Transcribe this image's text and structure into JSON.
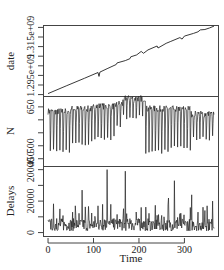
{
  "chart_data": {
    "type": "line",
    "title": "",
    "layout": "3 stacked panels sharing x-axis",
    "xlabel": "Time",
    "x_ticks": [
      0,
      100,
      200,
      300
    ],
    "xlim": [
      -10,
      375
    ],
    "grid": false,
    "legend": null,
    "panels": [
      {
        "name": "date",
        "ylabel": "date",
        "y_tick_labels": [
          "1.295e+09",
          "1.315e+09"
        ],
        "y_ticks": [
          1285000000.0,
          1290000000.0,
          1295000000.0,
          1300000000.0,
          1305000000.0,
          1310000000.0,
          1315000000.0,
          1320000000.0
        ],
        "ylim": [
          1284000000.0,
          1321000000.0
        ],
        "description": "approximately linear increase with small dips/steps",
        "series": {
          "x": [
            0,
            40,
            80,
            110,
            112,
            114,
            130,
            150,
            152,
            170,
            180,
            182,
            195,
            205,
            210,
            220,
            240,
            242,
            260,
            270,
            290,
            295,
            300,
            320,
            330,
            335,
            345,
            355,
            365
          ],
          "y": [
            1285500000.0,
            1289500000.0,
            1293500000.0,
            1296500000.0,
            1294500000.0,
            1296700000.0,
            1298500000.0,
            1300700000.0,
            1301500000.0,
            1302700000.0,
            1303700000.0,
            1304700000.0,
            1305700000.0,
            1307500000.0,
            1306500000.0,
            1308300000.0,
            1310300000.0,
            1309300000.0,
            1311700000.0,
            1312700000.0,
            1314700000.0,
            1313900000.0,
            1315500000.0,
            1316900000.0,
            1317700000.0,
            1318700000.0,
            1318900000.0,
            1319700000.0,
            1320700000.0
          ]
        }
      },
      {
        "name": "N",
        "ylabel": "N",
        "y_tick_labels": [
          "450",
          "500",
          "650"
        ],
        "y_ticks": [
          450,
          500,
          550,
          600,
          650
        ],
        "ylim": [
          420,
          690
        ],
        "description": "weekly oscillation between ~460 and ~640; higher plateau ~660-680 around t=165-215",
        "series": {
          "pattern": "weekly",
          "baseline_high": [
            630,
            640,
            650,
            660,
            680,
            640,
            640,
            620
          ],
          "baseline_low": [
            470,
            500,
            520,
            560,
            600,
            470,
            480,
            520
          ],
          "segments_x": [
            0,
            50,
            100,
            150,
            165,
            215,
            265,
            315,
            365
          ]
        }
      },
      {
        "name": "Delays",
        "ylabel": "Delays",
        "y_tick_labels": [
          "0",
          "20000",
          "20000"
        ],
        "y_ticks": [
          0,
          10000,
          20000,
          30000,
          40000
        ],
        "ylim": [
          -2500,
          42000
        ],
        "description": "noisy series near 3000-8000 with spikes up to ~40000",
        "series": {
          "spikes": [
            {
              "x": 60,
              "y": 17000
            },
            {
              "x": 75,
              "y": 27000
            },
            {
              "x": 110,
              "y": 17000
            },
            {
              "x": 120,
              "y": 18000
            },
            {
              "x": 130,
              "y": 40000
            },
            {
              "x": 138,
              "y": 18000
            },
            {
              "x": 170,
              "y": 39000
            },
            {
              "x": 205,
              "y": 16000
            },
            {
              "x": 240,
              "y": 11000
            },
            {
              "x": 255,
              "y": 10000
            },
            {
              "x": 265,
              "y": 22000
            },
            {
              "x": 278,
              "y": 33000
            },
            {
              "x": 290,
              "y": 12000
            },
            {
              "x": 316,
              "y": 24000
            },
            {
              "x": 330,
              "y": 13000
            },
            {
              "x": 345,
              "y": 14000
            },
            {
              "x": 350,
              "y": 17000
            },
            {
              "x": 362,
              "y": 20000
            }
          ],
          "baseline_range": [
            1000,
            9000
          ]
        }
      }
    ]
  }
}
